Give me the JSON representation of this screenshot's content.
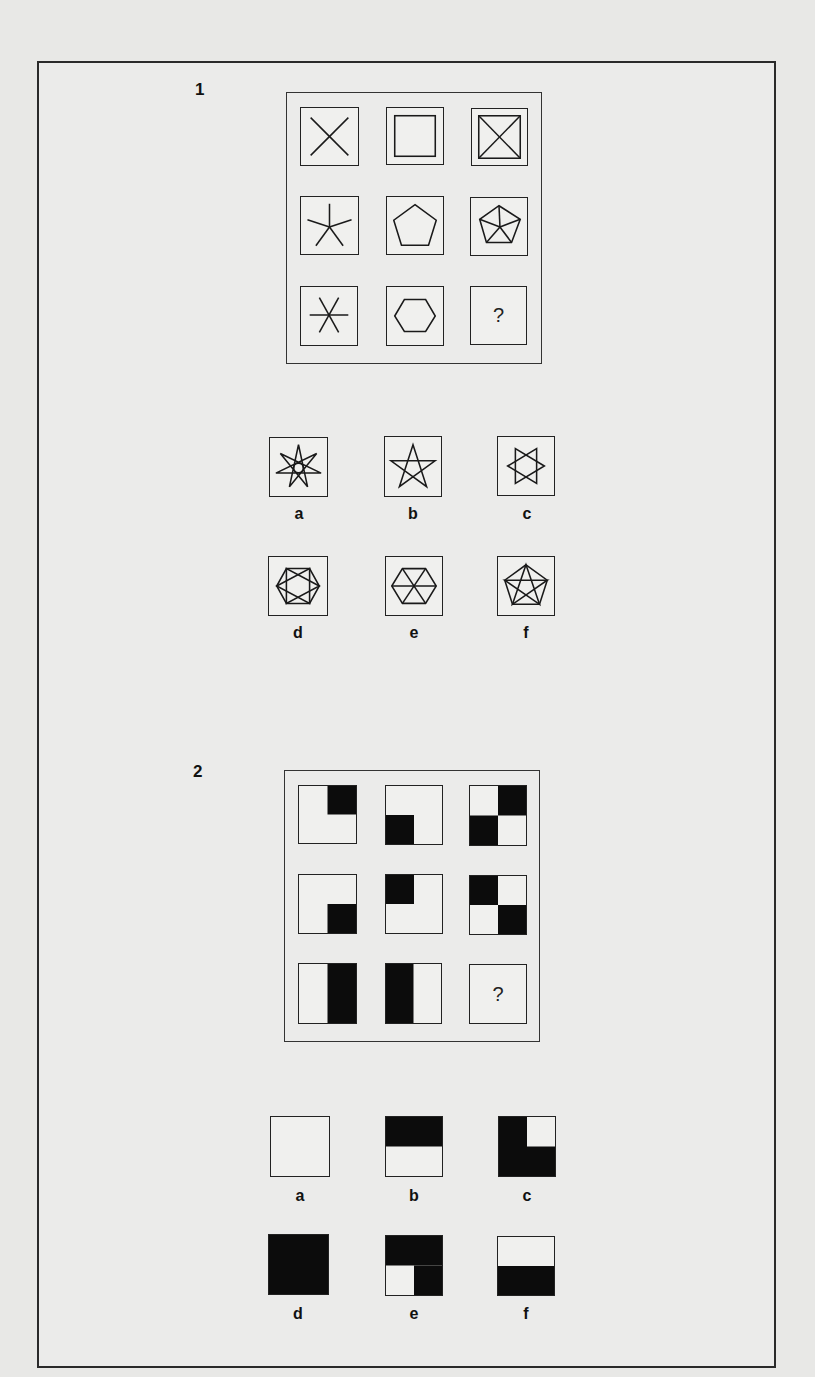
{
  "puzzles": [
    {
      "number": "1",
      "matrix": [
        [
          "x-cross",
          "square-in-square",
          "square-with-diagonals"
        ],
        [
          "five-spoke-star",
          "pentagon",
          "pentagon-with-spokes"
        ],
        [
          "six-spoke-star",
          "hexagon",
          "?"
        ]
      ],
      "missing_label": "?",
      "options": [
        {
          "label": "a",
          "figure": "seven-pointed-star-with-circle"
        },
        {
          "label": "b",
          "figure": "five-pointed-star"
        },
        {
          "label": "c",
          "figure": "six-pointed-star"
        },
        {
          "label": "d",
          "figure": "hexagon-with-star"
        },
        {
          "label": "e",
          "figure": "hexagon-with-spokes"
        },
        {
          "label": "f",
          "figure": "pentagon-with-pentagram"
        }
      ]
    },
    {
      "number": "2",
      "matrix": [
        [
          "top-right-black",
          "bottom-left-black",
          "top-right-and-bottom-left-black"
        ],
        [
          "bottom-right-black",
          "top-left-black",
          "top-left-and-bottom-right-black"
        ],
        [
          "right-half-black",
          "left-half-black",
          "?"
        ]
      ],
      "missing_label": "?",
      "options": [
        {
          "label": "a",
          "figure": "all-white"
        },
        {
          "label": "b",
          "figure": "top-half-black"
        },
        {
          "label": "c",
          "figure": "black-except-top-right"
        },
        {
          "label": "d",
          "figure": "all-black"
        },
        {
          "label": "e",
          "figure": "black-except-bottom-left"
        },
        {
          "label": "f",
          "figure": "bottom-half-black"
        }
      ]
    }
  ]
}
